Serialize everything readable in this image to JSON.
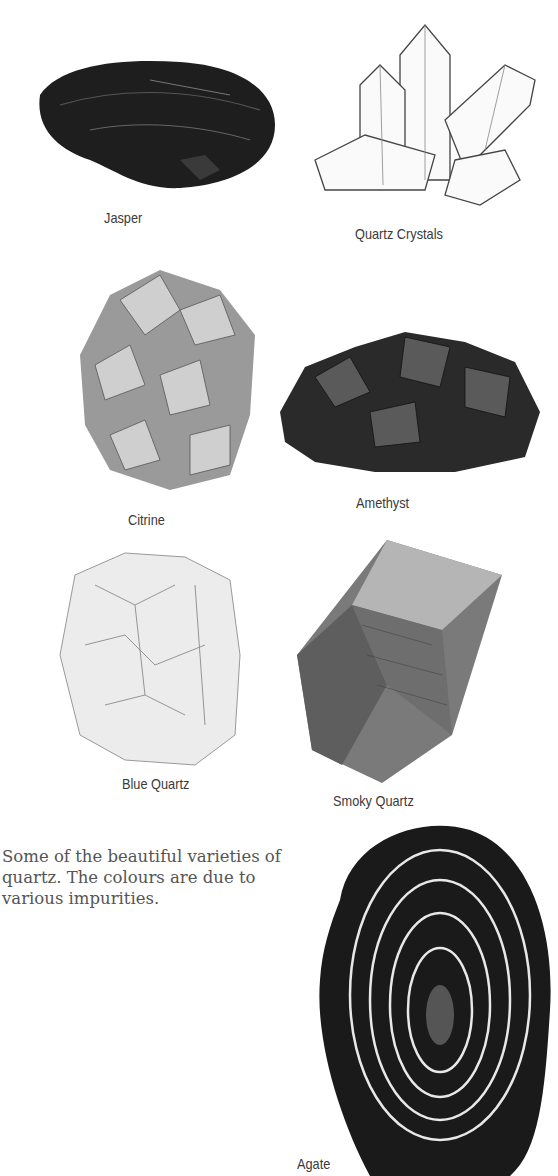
{
  "page": {
    "specimens": [
      {
        "id": "jasper",
        "label": "Jasper"
      },
      {
        "id": "quartz-crystals",
        "label": "Quartz Crystals"
      },
      {
        "id": "citrine",
        "label": "Citrine"
      },
      {
        "id": "amethyst",
        "label": "Amethyst"
      },
      {
        "id": "blue-quartz",
        "label": "Blue Quartz"
      },
      {
        "id": "smoky-quartz",
        "label": "Smoky Quartz"
      },
      {
        "id": "agate",
        "label": "Agate"
      }
    ],
    "caption": "Some of the beautiful varieties of quartz. The colours are due to various impurities."
  }
}
